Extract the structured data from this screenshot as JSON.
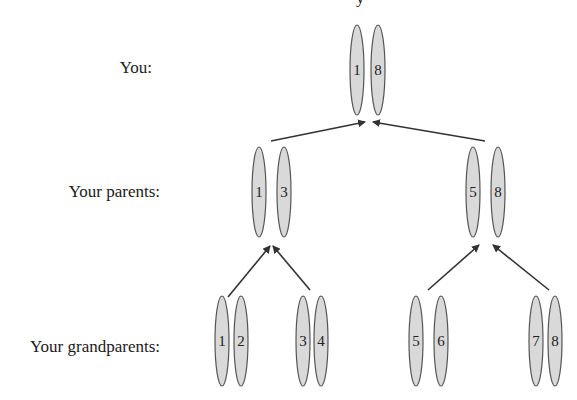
{
  "diagram": {
    "title_fragment": "y",
    "colors": {
      "chromosome_fill": "#d9d9d9",
      "chromosome_stroke": "#555555",
      "arrow": "#333333",
      "text": "#1a1a1a",
      "background": "#ffffff"
    },
    "rows": [
      {
        "label": "You:",
        "chromosomes": [
          {
            "number": "1",
            "cx": 357,
            "cy": 70,
            "rx": 7,
            "ry": 45
          },
          {
            "number": "8",
            "cx": 378,
            "cy": 70,
            "rx": 7,
            "ry": 45
          }
        ]
      },
      {
        "label": "Your parents:",
        "chromosomes": [
          {
            "number": "1",
            "cx": 259,
            "cy": 192,
            "rx": 7,
            "ry": 45
          },
          {
            "number": "3",
            "cx": 284,
            "cy": 192,
            "rx": 7,
            "ry": 45
          },
          {
            "number": "5",
            "cx": 473,
            "cy": 192,
            "rx": 7,
            "ry": 45
          },
          {
            "number": "8",
            "cx": 498,
            "cy": 192,
            "rx": 7,
            "ry": 45
          }
        ]
      },
      {
        "label": "Your grandparents:",
        "chromosomes": [
          {
            "number": "1",
            "cx": 222,
            "cy": 341,
            "rx": 7,
            "ry": 45
          },
          {
            "number": "2",
            "cx": 241,
            "cy": 341,
            "rx": 7,
            "ry": 45
          },
          {
            "number": "3",
            "cx": 303,
            "cy": 341,
            "rx": 7,
            "ry": 45
          },
          {
            "number": "4",
            "cx": 321,
            "cy": 341,
            "rx": 7,
            "ry": 45
          },
          {
            "number": "5",
            "cx": 416,
            "cy": 341,
            "rx": 7,
            "ry": 45
          },
          {
            "number": "6",
            "cx": 441,
            "cy": 341,
            "rx": 7,
            "ry": 45
          },
          {
            "number": "7",
            "cx": 536,
            "cy": 341,
            "rx": 7,
            "ry": 45
          },
          {
            "number": "8",
            "cx": 555,
            "cy": 341,
            "rx": 7,
            "ry": 45
          }
        ]
      }
    ],
    "arrows": [
      {
        "from": "parent-left",
        "x1": 271,
        "y1": 141,
        "x2": 365,
        "y2": 122
      },
      {
        "from": "parent-right",
        "x1": 485,
        "y1": 141,
        "x2": 373,
        "y2": 122
      },
      {
        "from": "grandparents-1-2",
        "x1": 228,
        "y1": 297,
        "x2": 270,
        "y2": 246
      },
      {
        "from": "grandparents-3-4",
        "x1": 310,
        "y1": 290,
        "x2": 273,
        "y2": 246
      },
      {
        "from": "grandparents-5-6",
        "x1": 428,
        "y1": 290,
        "x2": 479,
        "y2": 245
      },
      {
        "from": "grandparents-7-8",
        "x1": 549,
        "y1": 290,
        "x2": 493,
        "y2": 245
      }
    ]
  }
}
